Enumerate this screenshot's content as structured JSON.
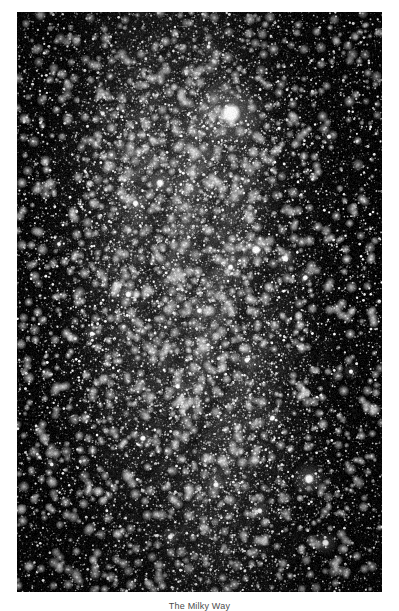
{
  "page": {
    "background_color": "#ffffff",
    "width": 399,
    "height": 611
  },
  "figure": {
    "name": "milky-way-photograph",
    "type": "monochrome-astrophotograph",
    "caption": "The Milky Way",
    "caption_clipped": true,
    "plate": {
      "x": 17,
      "y": 12,
      "width": 365,
      "height": 580,
      "background_color": "#050505",
      "border_color": "#000000"
    },
    "palette": {
      "sky": "#050505",
      "faint_star": "#6e6e6e",
      "mid_star": "#b4b4b4",
      "bright_star": "#ffffff",
      "glow": "#d8d8d8"
    },
    "bright_stars": [
      {
        "x": 0.585,
        "y": 0.175,
        "r": 10.5,
        "mag": 1.0
      },
      {
        "x": 0.392,
        "y": 0.295,
        "r": 4.2,
        "mag": 0.92
      },
      {
        "x": 0.325,
        "y": 0.33,
        "r": 3.4,
        "mag": 0.85
      },
      {
        "x": 0.655,
        "y": 0.41,
        "r": 5.0,
        "mag": 0.95
      },
      {
        "x": 0.735,
        "y": 0.425,
        "r": 3.6,
        "mag": 0.88
      },
      {
        "x": 0.585,
        "y": 0.44,
        "r": 3.2,
        "mag": 0.8
      },
      {
        "x": 0.79,
        "y": 0.458,
        "r": 3.0,
        "mag": 0.78
      },
      {
        "x": 0.305,
        "y": 0.487,
        "r": 3.3,
        "mag": 0.82
      },
      {
        "x": 0.5,
        "y": 0.515,
        "r": 3.0,
        "mag": 0.8
      },
      {
        "x": 0.205,
        "y": 0.555,
        "r": 2.8,
        "mag": 0.75
      },
      {
        "x": 0.63,
        "y": 0.6,
        "r": 3.1,
        "mag": 0.8
      },
      {
        "x": 0.44,
        "y": 0.645,
        "r": 2.9,
        "mag": 0.78
      },
      {
        "x": 0.7,
        "y": 0.7,
        "r": 3.0,
        "mag": 0.8
      },
      {
        "x": 0.345,
        "y": 0.735,
        "r": 3.2,
        "mag": 0.82
      },
      {
        "x": 0.8,
        "y": 0.805,
        "r": 5.2,
        "mag": 0.95
      },
      {
        "x": 0.545,
        "y": 0.815,
        "r": 3.0,
        "mag": 0.8
      },
      {
        "x": 0.665,
        "y": 0.86,
        "r": 3.0,
        "mag": 0.78
      },
      {
        "x": 0.42,
        "y": 0.905,
        "r": 3.0,
        "mag": 0.8
      },
      {
        "x": 0.845,
        "y": 0.915,
        "r": 3.8,
        "mag": 0.85
      },
      {
        "x": 0.235,
        "y": 0.175,
        "r": 2.6,
        "mag": 0.72
      },
      {
        "x": 0.855,
        "y": 0.215,
        "r": 2.6,
        "mag": 0.72
      },
      {
        "x": 0.115,
        "y": 0.4,
        "r": 2.4,
        "mag": 0.68
      },
      {
        "x": 0.915,
        "y": 0.62,
        "r": 2.6,
        "mag": 0.7
      },
      {
        "x": 0.095,
        "y": 0.78,
        "r": 2.4,
        "mag": 0.68
      },
      {
        "x": 0.525,
        "y": 0.06,
        "r": 2.4,
        "mag": 0.7
      }
    ],
    "band": {
      "note": "luminous galactic band, brightest between y=0.30 and y=0.72",
      "center_x": 0.47,
      "peak_y": 0.5,
      "width": 0.3
    },
    "dust_lanes": [
      {
        "x": 0.47,
        "y": 0.52,
        "angle": -78
      },
      {
        "x": 0.56,
        "y": 0.62,
        "angle": -70
      },
      {
        "x": 0.38,
        "y": 0.4,
        "angle": -84
      }
    ]
  }
}
